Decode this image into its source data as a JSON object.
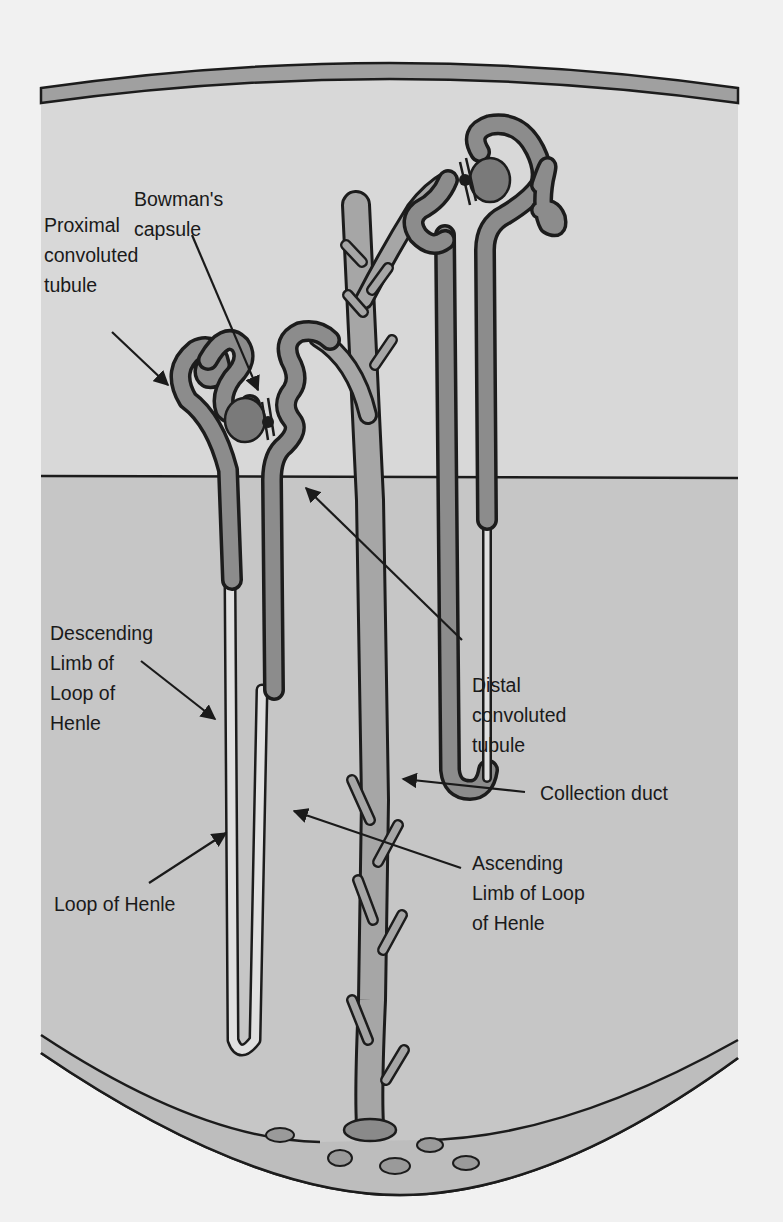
{
  "figure": {
    "regions": {
      "cortex": {
        "color": "#d8d8d8"
      },
      "medulla": {
        "color": "#c6c6c6"
      },
      "background": {
        "color": "#f1f1f1"
      },
      "tubule_fill": {
        "color": "#8c8c8c"
      },
      "duct_fill": {
        "color": "#a6a6a6"
      },
      "outline": {
        "color": "#1c1c1c"
      }
    }
  },
  "labels": {
    "proximal": "Proximal\nconvoluted\ntubule",
    "bowman": "Bowman's\ncapsule",
    "descending": "Descending\nLimb of\nLoop of\nHenle",
    "loop": "Loop of Henle",
    "distal": "Distal\nconvoluted\ntubule",
    "collection": "Collection duct",
    "ascending": "Ascending\nLimb of Loop\nof Henle"
  }
}
